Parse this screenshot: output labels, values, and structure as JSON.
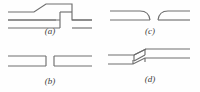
{
  "figure": {
    "background_color": "#fefefe",
    "line_color": "#6e6e6e",
    "label_color": "#3d3d3d",
    "panel_count": 4
  },
  "panels": [
    {
      "id": "a",
      "label": "(a)",
      "name": "offset-step-joint",
      "description": "Two parallel sheets with a raised offset step: a diagonal ramp rises to a raised plateau, then drops vertically down to the lower run.",
      "position": "top-left"
    },
    {
      "id": "b",
      "label": "(b)",
      "name": "butt-joint-with-gap",
      "description": "Two straight parallel-sided bars aligned end to end with a square gap between their closed ends.",
      "position": "bottom-left"
    },
    {
      "id": "c",
      "label": "(c)",
      "name": "tapered-gap-joint",
      "description": "Two sheets whose facing ends taper/curve inward, separated by a gap.",
      "position": "top-right"
    },
    {
      "id": "d",
      "label": "(d)",
      "name": "z-scarf-lap-joint",
      "description": "Two sheets joined by a Z-shaped stepped scarf in the middle of the run.",
      "position": "bottom-right"
    }
  ]
}
